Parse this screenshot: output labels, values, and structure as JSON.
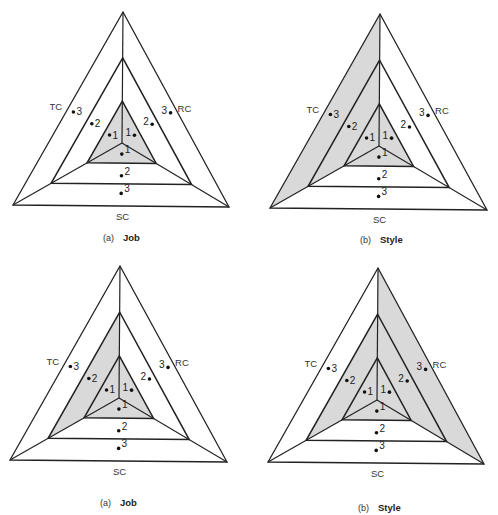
{
  "figure": {
    "shade_color": "#d9d9d9",
    "line_color": "#222222",
    "axis_labels": {
      "left": "TC",
      "right": "RC",
      "bottom": "SC"
    },
    "level_labels": [
      "1",
      "2",
      "3"
    ]
  },
  "panels": [
    {
      "id": "top-left",
      "caption_letter": "(a)",
      "caption_title": "Job",
      "apex": [
        123,
        12
      ],
      "bl": [
        13,
        205
      ],
      "br": [
        229,
        207
      ],
      "center": [
        122,
        143
      ],
      "caption_pos": [
        122,
        241
      ],
      "shaded_levels": {
        "TC": 1,
        "RC": 1,
        "SC": 1
      }
    },
    {
      "id": "top-right",
      "caption_letter": "(b)",
      "caption_title": "Style",
      "apex": [
        380,
        14
      ],
      "bl": [
        270,
        208
      ],
      "br": [
        487,
        210
      ],
      "center": [
        379,
        146
      ],
      "caption_pos": [
        379,
        243
      ],
      "shaded_levels": {
        "TC": 3,
        "RC": 1,
        "SC": 1
      }
    },
    {
      "id": "bottom-left",
      "caption_letter": "(a)",
      "caption_title": "Job",
      "apex": [
        120,
        266
      ],
      "bl": [
        10,
        460
      ],
      "br": [
        227,
        462
      ],
      "center": [
        119,
        398
      ],
      "caption_pos": [
        119,
        506
      ],
      "shaded_levels": {
        "TC": 2,
        "RC": 1,
        "SC": 1
      }
    },
    {
      "id": "bottom-right",
      "caption_letter": "(b)",
      "caption_title": "Style",
      "apex": [
        378,
        268
      ],
      "bl": [
        268,
        462
      ],
      "br": [
        484,
        464
      ],
      "center": [
        377,
        400
      ],
      "caption_pos": [
        377,
        511
      ],
      "shaded_levels": {
        "TC": 2,
        "RC": 3,
        "SC": 1
      }
    }
  ]
}
